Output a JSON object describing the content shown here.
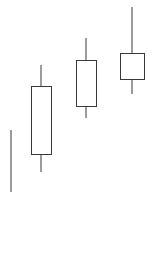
{
  "chart_data": {
    "type": "candlestick",
    "title": "",
    "subtitle": "",
    "xlabel": "",
    "ylabel": "",
    "grid": false,
    "legend": false,
    "axes_visible": false,
    "background_color": "#ffffff",
    "line_color": "#3a3a3a",
    "up_body_style": "hollow",
    "ylim": [
      96,
      144
    ],
    "categories": [
      "1",
      "2",
      "3",
      "4"
    ],
    "candles": [
      {
        "label": "1",
        "open": 100.0,
        "high": 113.4,
        "low": 100.0,
        "close": 100.0,
        "direction": "doji",
        "body_style": "none",
        "center_x": 11,
        "body_left": 11,
        "body_right": 11,
        "wick_top_y": 130,
        "body_top_y": 161,
        "body_bottom_y": 161,
        "wick_bottom_y": 192
      },
      {
        "label": "2",
        "open": 104.3,
        "high": 127.4,
        "low": 104.3,
        "close": 119.2,
        "direction": "up",
        "body_style": "hollow",
        "center_x": 41,
        "body_left": 31,
        "body_right": 52,
        "wick_top_y": 65,
        "body_top_y": 86,
        "body_bottom_y": 155,
        "wick_bottom_y": 172
      },
      {
        "label": "3",
        "open": 115.9,
        "high": 133.3,
        "low": 115.9,
        "close": 126.1,
        "direction": "up",
        "body_style": "hollow",
        "center_x": 86,
        "body_left": 76,
        "body_right": 97,
        "wick_top_y": 38,
        "body_top_y": 60,
        "body_bottom_y": 107,
        "wick_bottom_y": 118
      },
      {
        "label": "4",
        "open": 121.1,
        "high": 140.0,
        "low": 121.1,
        "close": 127.6,
        "direction": "up",
        "body_style": "hollow",
        "center_x": 132,
        "body_left": 120,
        "body_right": 145,
        "wick_top_y": 7,
        "body_top_y": 53,
        "body_bottom_y": 80,
        "wick_bottom_y": 94
      }
    ]
  }
}
